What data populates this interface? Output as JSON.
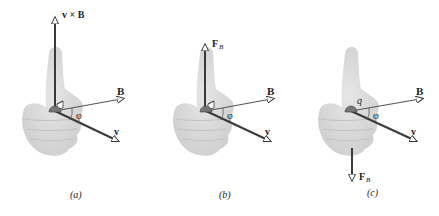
{
  "figure": {
    "panels": [
      {
        "id": "a",
        "caption": "(a)",
        "vertical_label_main": "v × B",
        "vertical_direction": "up",
        "b_label": "B",
        "v_label": "v",
        "angle_label": "φ",
        "show_right_angle": true,
        "show_charge": false
      },
      {
        "id": "b",
        "caption": "(b)",
        "vertical_label_main": "F",
        "vertical_label_sub": "B",
        "vertical_direction": "up",
        "b_label": "B",
        "v_label": "v",
        "angle_label": "φ",
        "show_right_angle": true,
        "show_charge": false
      },
      {
        "id": "c",
        "caption": "(c)",
        "vertical_label_main": "F",
        "vertical_label_sub": "B",
        "vertical_direction": "down",
        "b_label": "B",
        "v_label": "v",
        "angle_label": "φ",
        "charge_label": "q",
        "show_right_angle": false,
        "show_charge": true
      }
    ],
    "colors": {
      "vector": "#3a3a3a",
      "hand": "#d9d9d9",
      "hand_shadow": "#c4c4c4",
      "text": "#222222"
    }
  }
}
